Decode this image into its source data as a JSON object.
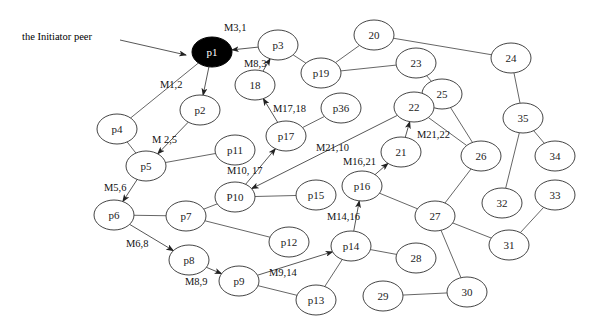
{
  "diagram": {
    "annotation": {
      "label": "the Initiator peer",
      "x": 22,
      "y": 40,
      "arrow_from": [
        120,
        40
      ],
      "arrow_to": [
        186,
        55
      ]
    },
    "nodes": [
      {
        "id": "p1",
        "label": "p1",
        "x": 212,
        "y": 52,
        "initiator": true
      },
      {
        "id": "p3",
        "label": "p3",
        "x": 278,
        "y": 45
      },
      {
        "id": "18",
        "label": "18",
        "x": 255,
        "y": 85
      },
      {
        "id": "p2",
        "label": "p2",
        "x": 200,
        "y": 110
      },
      {
        "id": "p4",
        "label": "p4",
        "x": 117,
        "y": 129
      },
      {
        "id": "p5",
        "label": "p5",
        "x": 146,
        "y": 166
      },
      {
        "id": "p11",
        "label": "p11",
        "x": 235,
        "y": 150
      },
      {
        "id": "p17",
        "label": "p17",
        "x": 286,
        "y": 136
      },
      {
        "id": "p36",
        "label": "p36",
        "x": 341,
        "y": 108
      },
      {
        "id": "p19",
        "label": "p19",
        "x": 321,
        "y": 73
      },
      {
        "id": "20",
        "label": "20",
        "x": 374,
        "y": 35
      },
      {
        "id": "23",
        "label": "23",
        "x": 416,
        "y": 63
      },
      {
        "id": "24",
        "label": "24",
        "x": 511,
        "y": 58
      },
      {
        "id": "25",
        "label": "25",
        "x": 442,
        "y": 94
      },
      {
        "id": "22",
        "label": "22",
        "x": 414,
        "y": 107
      },
      {
        "id": "35",
        "label": "35",
        "x": 523,
        "y": 118
      },
      {
        "id": "34",
        "label": "34",
        "x": 555,
        "y": 156
      },
      {
        "id": "21",
        "label": "21",
        "x": 401,
        "y": 152
      },
      {
        "id": "26",
        "label": "26",
        "x": 481,
        "y": 156
      },
      {
        "id": "p16",
        "label": "p16",
        "x": 362,
        "y": 186
      },
      {
        "id": "P10",
        "label": "P10",
        "x": 235,
        "y": 197
      },
      {
        "id": "p15",
        "label": "p15",
        "x": 316,
        "y": 195
      },
      {
        "id": "32",
        "label": "32",
        "x": 502,
        "y": 203
      },
      {
        "id": "33",
        "label": "33",
        "x": 555,
        "y": 195
      },
      {
        "id": "p6",
        "label": "p6",
        "x": 114,
        "y": 215
      },
      {
        "id": "p7",
        "label": "p7",
        "x": 186,
        "y": 216
      },
      {
        "id": "p12",
        "label": "p12",
        "x": 289,
        "y": 242
      },
      {
        "id": "27",
        "label": "27",
        "x": 435,
        "y": 216
      },
      {
        "id": "p8",
        "label": "p8",
        "x": 189,
        "y": 260
      },
      {
        "id": "p9",
        "label": "p9",
        "x": 239,
        "y": 281
      },
      {
        "id": "p14",
        "label": "p14",
        "x": 351,
        "y": 246
      },
      {
        "id": "28",
        "label": "28",
        "x": 416,
        "y": 258
      },
      {
        "id": "31",
        "label": "31",
        "x": 509,
        "y": 245
      },
      {
        "id": "p13",
        "label": "p13",
        "x": 316,
        "y": 300
      },
      {
        "id": "29",
        "label": "29",
        "x": 383,
        "y": 296
      },
      {
        "id": "30",
        "label": "30",
        "x": 467,
        "y": 292
      }
    ],
    "edges": [
      [
        "p1",
        "p4"
      ],
      [
        "p3",
        "p19"
      ],
      [
        "p4",
        "p5"
      ],
      [
        "p5",
        "p11"
      ],
      [
        "p19",
        "20"
      ],
      [
        "p19",
        "23"
      ],
      [
        "20",
        "24"
      ],
      [
        "23",
        "25"
      ],
      [
        "24",
        "35"
      ],
      [
        "25",
        "26"
      ],
      [
        "22",
        "26"
      ],
      [
        "35",
        "34"
      ],
      [
        "35",
        "32"
      ],
      [
        "p17",
        "p36"
      ],
      [
        "26",
        "27"
      ],
      [
        "p16",
        "27"
      ],
      [
        "P10",
        "p15"
      ],
      [
        "P10",
        "p7"
      ],
      [
        "p6",
        "p7"
      ],
      [
        "p7",
        "p12"
      ],
      [
        "27",
        "31"
      ],
      [
        "33",
        "31"
      ],
      [
        "27",
        "30"
      ],
      [
        "p14",
        "28"
      ],
      [
        "p14",
        "p13"
      ],
      [
        "p9",
        "p13"
      ],
      [
        "29",
        "30"
      ]
    ],
    "messages": [
      {
        "from": "p3",
        "to": "p1",
        "label": "M3,1",
        "lx": 224,
        "ly": 31
      },
      {
        "from": "p1",
        "to": "p2",
        "label": "M1,2",
        "lx": 160,
        "ly": 88
      },
      {
        "from": "18",
        "to": "p3",
        "label": "M8,3",
        "lx": 244,
        "ly": 67
      },
      {
        "from": "p17",
        "to": "18",
        "label": "M17,18",
        "lx": 273,
        "ly": 112
      },
      {
        "from": "p2",
        "to": "p5",
        "label": "M 2,5",
        "lx": 152,
        "ly": 143
      },
      {
        "from": "p5",
        "to": "p6",
        "label": "M5,6",
        "lx": 104,
        "ly": 191
      },
      {
        "from": "P10",
        "to": "p17",
        "label": "M10, 17",
        "lx": 227,
        "ly": 174
      },
      {
        "from": "22",
        "to": "P10",
        "label": "M21,10",
        "lx": 316,
        "ly": 151
      },
      {
        "from": "21",
        "to": "22",
        "label": "M21,22",
        "lx": 417,
        "ly": 138
      },
      {
        "from": "p16",
        "to": "21",
        "label": "M16,21",
        "lx": 343,
        "ly": 165
      },
      {
        "from": "p14",
        "to": "p16",
        "label": "M14,16",
        "lx": 327,
        "ly": 220
      },
      {
        "from": "p6",
        "to": "p8",
        "label": "M6,8",
        "lx": 126,
        "ly": 247
      },
      {
        "from": "p8",
        "to": "p9",
        "label": "M8,9",
        "lx": 185,
        "ly": 285
      },
      {
        "from": "p9",
        "to": "p14",
        "label": "M9,14",
        "lx": 269,
        "ly": 276
      }
    ]
  }
}
